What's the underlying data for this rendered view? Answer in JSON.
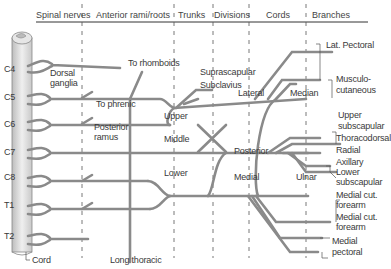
{
  "headers": {
    "spinal_nerves": "Spinal nerves",
    "anterior_rami": "Anterior rami/roots",
    "trunks": "Trunks",
    "divisions": "Divisions",
    "cords": "Cords",
    "branches": "Branches"
  },
  "spinal_levels": [
    "C4",
    "C5",
    "C6",
    "C7",
    "C8",
    "T1",
    "T2"
  ],
  "labels": {
    "dorsal_ganglia_1": "Dorsal",
    "dorsal_ganglia_2": "ganglia",
    "to_rhomboids": "To rhomboids",
    "to_phrenic": "To phrenic",
    "posterior_ramus_1": "Posterior",
    "posterior_ramus_2": "ramus",
    "cord": "Cord",
    "long_thoracic": "Long thoracic"
  },
  "trunks": {
    "upper": "Upper",
    "middle": "Middle",
    "lower": "Lower"
  },
  "trunk_branches": {
    "suprascapular": "Suprascapular",
    "subclavius": "Subclavius"
  },
  "cords": {
    "lateral": "Lateral",
    "posterior": "Posterior",
    "medial": "Medial"
  },
  "terminal": {
    "median": "Median",
    "ulnar": "Ulnar"
  },
  "branches": {
    "lat_pectoral": "Lat. Pectoral",
    "musculo_1": "Musculo-",
    "musculo_2": "cutaneous",
    "upper_sub_1": "Upper",
    "upper_sub_2": "subscapular",
    "thoracodorsal": "Thoracodorsal",
    "radial": "Radial",
    "axillary": "Axillary",
    "lower_sub_1": "Lower",
    "lower_sub_2": "subscapular",
    "medial_cut_1a": "Medial cut.",
    "medial_cut_1b": "forearm",
    "medial_cut_2a": "Medial cut.",
    "medial_cut_2b": "forearm",
    "medial_pec_1": "Medial",
    "medial_pec_2": "pectoral"
  },
  "colors": {
    "nerve": "#8a8a8a",
    "nerve_fill": "#e2e2e2",
    "cord_fill": "#d9d9d9",
    "text": "#3a3a3a"
  }
}
